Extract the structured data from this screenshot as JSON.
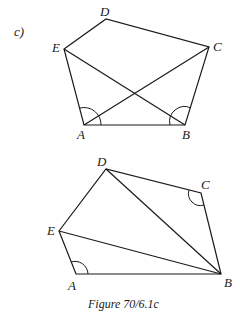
{
  "part_label": "c)",
  "caption": "Figure 70/6.1c",
  "figure1": {
    "labels": {
      "A": "A",
      "B": "B",
      "C": "C",
      "D": "D",
      "E": "E"
    },
    "points": {
      "A": [
        84,
        125
      ],
      "B": [
        185,
        125
      ],
      "C": [
        209,
        47
      ],
      "D": [
        106,
        19
      ],
      "E": [
        64,
        49
      ]
    },
    "edges": [
      [
        "A",
        "B"
      ],
      [
        "B",
        "C"
      ],
      [
        "C",
        "D"
      ],
      [
        "D",
        "E"
      ],
      [
        "E",
        "A"
      ],
      [
        "A",
        "C"
      ],
      [
        "E",
        "B"
      ]
    ],
    "marked_angles": [
      "EAC",
      "EBC"
    ]
  },
  "figure2": {
    "labels": {
      "A": "A",
      "B": "B",
      "C": "C",
      "D": "D",
      "E": "E"
    },
    "points": {
      "A": [
        76,
        274
      ],
      "B": [
        221,
        274
      ],
      "C": [
        201,
        193
      ],
      "D": [
        106,
        169
      ],
      "E": [
        59,
        231
      ]
    },
    "edges": [
      [
        "A",
        "B"
      ],
      [
        "B",
        "C"
      ],
      [
        "C",
        "D"
      ],
      [
        "D",
        "E"
      ],
      [
        "E",
        "A"
      ],
      [
        "D",
        "B"
      ],
      [
        "E",
        "B"
      ]
    ],
    "marked_angles": [
      "EAB",
      "DCB"
    ]
  }
}
